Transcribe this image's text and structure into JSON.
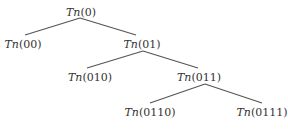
{
  "diagram": {
    "type": "binary-tree",
    "line_color": "#555555",
    "text_color": "#333333",
    "nodes": [
      {
        "id": "0",
        "fn": "Tn",
        "arg": "(0)",
        "x": 81,
        "y": 12
      },
      {
        "id": "00",
        "fn": "Tn",
        "arg": "(00)",
        "x": 23,
        "y": 44
      },
      {
        "id": "01",
        "fn": "Tn",
        "arg": "(01)",
        "x": 142,
        "y": 44
      },
      {
        "id": "010",
        "fn": "Tn",
        "arg": "(010)",
        "x": 90,
        "y": 77
      },
      {
        "id": "011",
        "fn": "Tn",
        "arg": "(011)",
        "x": 199,
        "y": 77
      },
      {
        "id": "0110",
        "fn": "Tn",
        "arg": "(0110)",
        "x": 150,
        "y": 112
      },
      {
        "id": "0111",
        "fn": "Tn",
        "arg": "(0111)",
        "x": 262,
        "y": 112
      }
    ],
    "edges": [
      {
        "from": "0",
        "to": "00",
        "x1": 80,
        "y1": 18,
        "x2": 25,
        "y2": 35
      },
      {
        "from": "0",
        "to": "01",
        "x1": 80,
        "y1": 18,
        "x2": 136,
        "y2": 35
      },
      {
        "from": "01",
        "to": "010",
        "x1": 143,
        "y1": 51,
        "x2": 87,
        "y2": 68
      },
      {
        "from": "01",
        "to": "011",
        "x1": 143,
        "y1": 51,
        "x2": 198,
        "y2": 68
      },
      {
        "from": "011",
        "to": "0110",
        "x1": 205,
        "y1": 84,
        "x2": 150,
        "y2": 103
      },
      {
        "from": "011",
        "to": "0111",
        "x1": 205,
        "y1": 84,
        "x2": 262,
        "y2": 103
      }
    ]
  }
}
